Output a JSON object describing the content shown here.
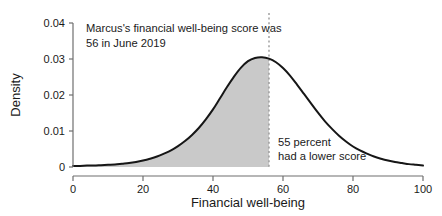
{
  "chart_data": {
    "type": "area",
    "title": "",
    "xlabel": "Financial well-being",
    "ylabel": "Density",
    "xlim": [
      0,
      100
    ],
    "ylim": [
      0,
      0.04
    ],
    "grid": false,
    "legend": null,
    "xticks": [
      "0",
      "20",
      "40",
      "60",
      "80",
      "100"
    ],
    "xtick_values": [
      0,
      20,
      40,
      60,
      80,
      100
    ],
    "yticks": [
      "0",
      "0.01",
      "0.02",
      "0.03",
      "0.04"
    ],
    "ytick_values": [
      0,
      0.01,
      0.02,
      0.03,
      0.04
    ],
    "series": [
      {
        "name": "Density of financial well-being score",
        "x": [
          0,
          2,
          4,
          6,
          8,
          10,
          12,
          14,
          16,
          18,
          20,
          22,
          24,
          26,
          28,
          30,
          32,
          34,
          36,
          38,
          40,
          42,
          44,
          46,
          48,
          50,
          52,
          54,
          56,
          58,
          60,
          62,
          64,
          66,
          68,
          70,
          72,
          74,
          76,
          78,
          80,
          82,
          84,
          86,
          88,
          90,
          92,
          94,
          96,
          98,
          100
        ],
        "values": [
          0.0003,
          0.0003,
          0.0004,
          0.0004,
          0.0005,
          0.0006,
          0.0007,
          0.0009,
          0.0011,
          0.0014,
          0.0018,
          0.0023,
          0.0029,
          0.0037,
          0.0046,
          0.0058,
          0.0072,
          0.0089,
          0.0109,
          0.0133,
          0.016,
          0.0191,
          0.0222,
          0.0251,
          0.0276,
          0.0294,
          0.0303,
          0.0305,
          0.0301,
          0.0291,
          0.0275,
          0.0254,
          0.0229,
          0.0203,
          0.0177,
          0.0151,
          0.0127,
          0.0106,
          0.0087,
          0.0071,
          0.0057,
          0.0046,
          0.0037,
          0.0029,
          0.0023,
          0.0018,
          0.0014,
          0.0011,
          0.0008,
          0.0006,
          0.0004
        ]
      }
    ],
    "shaded_region": {
      "label": "Area below Marcus's score",
      "x_from": 0,
      "x_to": 56,
      "fill_color": "#c9c9c9"
    },
    "marker_line": {
      "label": "Marcus's score",
      "x_value": 56,
      "style": "dotted",
      "color": "#9a9a9a"
    },
    "annotations": [
      {
        "name": "score-annotation",
        "lines": [
          "Marcus's financial well-being score was",
          "56 in June 2019"
        ]
      },
      {
        "name": "percentile-annotation",
        "lines": [
          "55 percent",
          "had a lower score"
        ]
      }
    ],
    "colors": {
      "curve": "#161616",
      "fill": "#c9c9c9",
      "axis": "#6f6f6f",
      "text": "#1a1a1a",
      "background": "#ffffff"
    }
  }
}
